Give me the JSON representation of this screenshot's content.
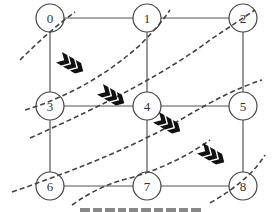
{
  "diagram": {
    "type": "grid-graph-wavefront",
    "nodes": [
      {
        "id": "0",
        "label": "0",
        "x": 50,
        "y": 18
      },
      {
        "id": "1",
        "label": "1",
        "x": 147,
        "y": 18
      },
      {
        "id": "2",
        "label": "2",
        "x": 243,
        "y": 18
      },
      {
        "id": "3",
        "label": "3",
        "x": 50,
        "y": 106
      },
      {
        "id": "4",
        "label": "4",
        "x": 147,
        "y": 106
      },
      {
        "id": "5",
        "label": "5",
        "x": 243,
        "y": 106
      },
      {
        "id": "6",
        "label": "6",
        "x": 50,
        "y": 186
      },
      {
        "id": "7",
        "label": "7",
        "x": 147,
        "y": 186
      },
      {
        "id": "8",
        "label": "8",
        "x": 243,
        "y": 186
      }
    ],
    "edges": [
      [
        "0",
        "1"
      ],
      [
        "1",
        "2"
      ],
      [
        "3",
        "4"
      ],
      [
        "4",
        "5"
      ],
      [
        "6",
        "7"
      ],
      [
        "7",
        "8"
      ],
      [
        "0",
        "3"
      ],
      [
        "3",
        "6"
      ],
      [
        "1",
        "4"
      ],
      [
        "4",
        "7"
      ],
      [
        "2",
        "5"
      ],
      [
        "5",
        "8"
      ]
    ],
    "wavefronts": 5,
    "arrows": {
      "symbol": "❯❯❯",
      "count": 4
    },
    "caption": "",
    "colors": {
      "line": "#555555",
      "arrow": "#111111",
      "background": "#ffffff"
    }
  }
}
